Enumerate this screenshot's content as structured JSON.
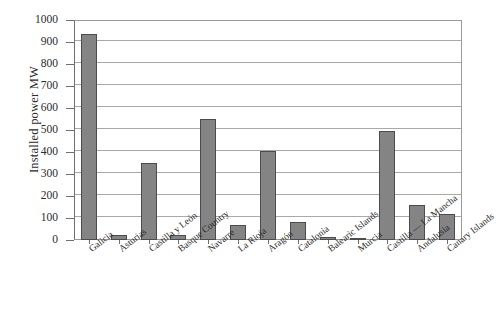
{
  "chart_data": {
    "type": "bar",
    "title": "",
    "subtitle": "",
    "xlabel": "",
    "ylabel": "Installed power MW",
    "ylim": [
      0,
      1000
    ],
    "ytick_step": 100,
    "yticks": [
      0,
      100,
      200,
      300,
      400,
      500,
      600,
      700,
      800,
      900,
      1000
    ],
    "grid": "horizontal",
    "legend": "none",
    "categories": [
      "Galicia",
      "Asturias",
      "Castilla y León",
      "Basque Country",
      "Navarre",
      "La Rioja",
      "Aragón",
      "Catalonia",
      "Balearic Islands",
      "Murcia",
      "Castilla — La Mancha",
      "Andalusia",
      "Canary Islands"
    ],
    "values": [
      935,
      22,
      350,
      25,
      550,
      70,
      405,
      80,
      12,
      8,
      497,
      158,
      118
    ],
    "series": [
      {
        "name": "Installed power MW",
        "values": [
          935,
          22,
          350,
          25,
          550,
          70,
          405,
          80,
          12,
          8,
          497,
          158,
          118
        ]
      }
    ]
  },
  "style": {
    "bar_fill": "#848484",
    "bar_border": "#4c4c4c",
    "gridline_color": "#a9a9a9",
    "axis_color": "#6f6f6f",
    "text_color": "#2b2b2b",
    "background": "#ffffff"
  }
}
